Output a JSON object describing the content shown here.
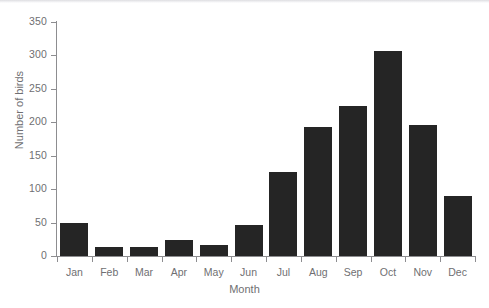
{
  "chart_data": {
    "type": "bar",
    "title": "",
    "xlabel": "Month",
    "ylabel": "Number of birds",
    "categories": [
      "Jan",
      "Feb",
      "Mar",
      "Apr",
      "May",
      "Jun",
      "Jul",
      "Aug",
      "Sep",
      "Oct",
      "Nov",
      "Dec"
    ],
    "values": [
      50,
      13,
      13,
      24,
      16,
      46,
      125,
      193,
      224,
      307,
      196,
      90
    ],
    "ylim": [
      0,
      350
    ],
    "yticks": [
      0,
      50,
      100,
      150,
      200,
      250,
      300,
      350
    ],
    "ytick_labels": [
      "0",
      "50",
      "100",
      "150",
      "200",
      "250",
      "300",
      "350"
    ],
    "grid": false,
    "legend": false,
    "bar_color": "#252525",
    "axis_color": "#8d8d90",
    "label_color": "#6f6f72",
    "background_color": "#ffffff"
  }
}
